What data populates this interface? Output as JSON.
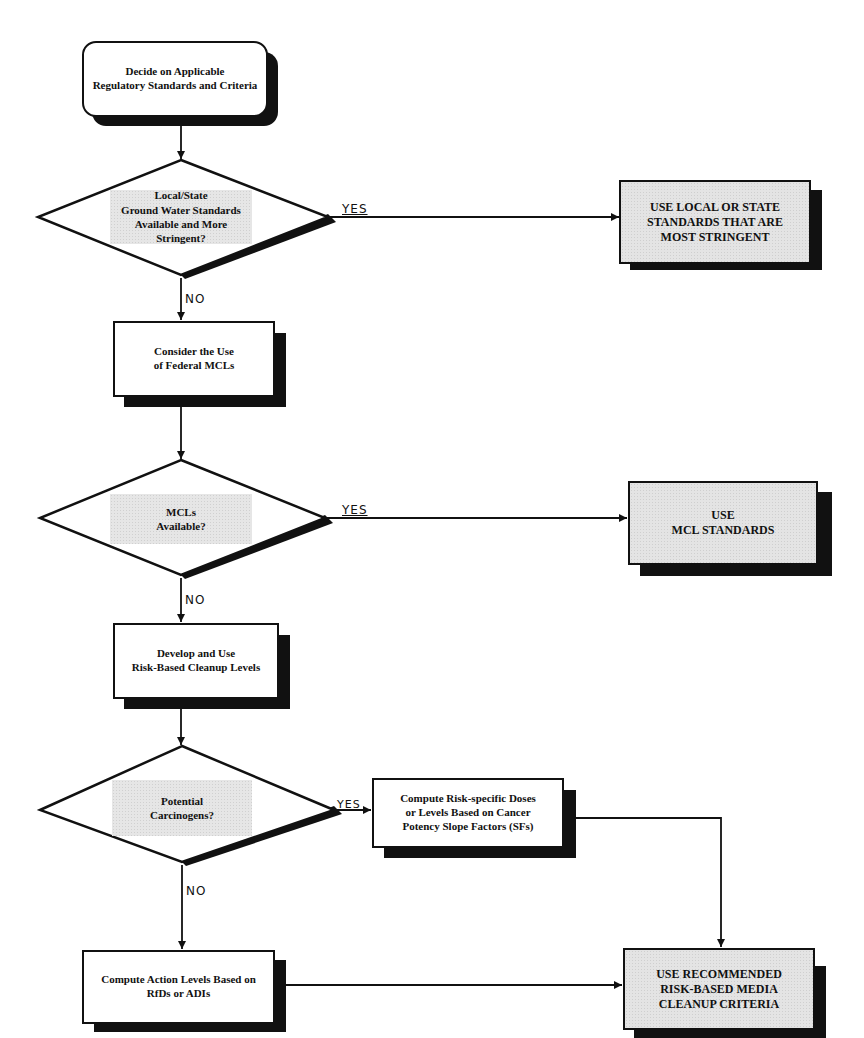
{
  "nodes": {
    "start": {
      "type": "terminal",
      "text": "Decide on Applicable\nRegulatory Standards and Criteria"
    },
    "decision_local_state": {
      "type": "decision",
      "text": "Local/State\nGround Water Standards\nAvailable and More Stringent?"
    },
    "use_local_state": {
      "type": "outcome",
      "text": "USE LOCAL OR STATE\nSTANDARDS THAT ARE\nMOST STRINGENT"
    },
    "consider_mcls": {
      "type": "process",
      "text": "Consider the Use\nof Federal MCLs"
    },
    "decision_mcls": {
      "type": "decision",
      "text": "MCLs\nAvailable?"
    },
    "use_mcl": {
      "type": "outcome",
      "text": "USE\nMCL STANDARDS"
    },
    "develop_risk": {
      "type": "process",
      "text": "Develop and Use\nRisk-Based Cleanup Levels"
    },
    "decision_carcinogens": {
      "type": "decision",
      "text": "Potential\nCarcinogens?"
    },
    "compute_risk_doses": {
      "type": "process",
      "text": "Compute Risk-specific Doses\nor Levels Based on Cancer\nPotency Slope Factors (SFs)"
    },
    "compute_action_levels": {
      "type": "process",
      "text": "Compute Action Levels Based on\nRfDs or ADIs"
    },
    "use_recommended": {
      "type": "outcome",
      "text": "USE RECOMMENDED\nRISK-BASED MEDIA\nCLEANUP CRITERIA"
    }
  },
  "edge_labels": {
    "yes": "YES",
    "no": "NO"
  },
  "edges": [
    {
      "from": "start",
      "to": "decision_local_state",
      "label": ""
    },
    {
      "from": "decision_local_state",
      "to": "use_local_state",
      "label": "YES"
    },
    {
      "from": "decision_local_state",
      "to": "consider_mcls",
      "label": "NO"
    },
    {
      "from": "consider_mcls",
      "to": "decision_mcls",
      "label": ""
    },
    {
      "from": "decision_mcls",
      "to": "use_mcl",
      "label": "YES"
    },
    {
      "from": "decision_mcls",
      "to": "develop_risk",
      "label": "NO"
    },
    {
      "from": "develop_risk",
      "to": "decision_carcinogens",
      "label": ""
    },
    {
      "from": "decision_carcinogens",
      "to": "compute_risk_doses",
      "label": "YES"
    },
    {
      "from": "decision_carcinogens",
      "to": "compute_action_levels",
      "label": "NO"
    },
    {
      "from": "compute_risk_doses",
      "to": "use_recommended",
      "label": ""
    },
    {
      "from": "compute_action_levels",
      "to": "use_recommended",
      "label": ""
    }
  ],
  "colors": {
    "line": "#111111",
    "shadow": "#111111",
    "fill_plain": "#ffffff",
    "fill_shaded": "#e4e4e4"
  }
}
